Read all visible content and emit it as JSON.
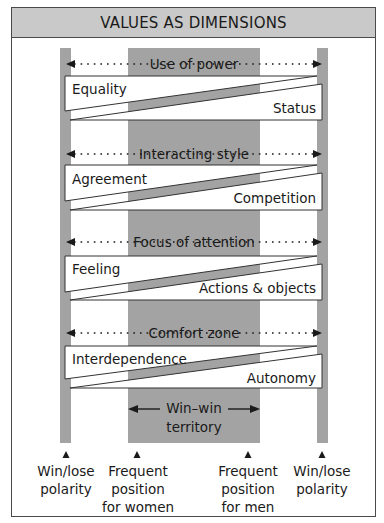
{
  "title": "VALUES AS DIMENSIONS",
  "dimensions": [
    {
      "name": "Use of power",
      "left_value": "Equality",
      "right_value": "Status"
    },
    {
      "name": "Interacting style",
      "left_value": "Agreement",
      "right_value": "Competition"
    },
    {
      "name": "Focus of attention",
      "left_value": "Feeling",
      "right_value": "Actions & objects"
    },
    {
      "name": "Comfort zone",
      "left_value": "Interdependence",
      "right_value": "Autonomy"
    }
  ],
  "win_win": {
    "line1": "Win–win",
    "line2": "territory"
  },
  "markers": [
    {
      "line1": "Win/lose",
      "line2": "polarity",
      "line3": ""
    },
    {
      "line1": "Frequent",
      "line2": "position",
      "line3": "for women"
    },
    {
      "line1": "Frequent",
      "line2": "position",
      "line3": "for men"
    },
    {
      "line1": "Win/lose",
      "line2": "polarity",
      "line3": ""
    }
  ],
  "colors": {
    "header_bg": "#c9c9c9",
    "band": "#a3a3a3",
    "border": "#4a4a4a"
  }
}
